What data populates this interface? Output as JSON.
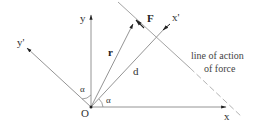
{
  "diagram": {
    "labels": {
      "y_axis": "y",
      "x_axis": "x",
      "y_prime_axis": "y'",
      "x_prime_axis": "x'",
      "origin": "O",
      "position_vector": "r",
      "force": "F",
      "distance": "d",
      "angle_left": "α",
      "angle_right": "α",
      "line_of_action_line1": "line of action",
      "line_of_action_line2": "of force"
    },
    "colors": {
      "axis": "#888888",
      "arrowhead": "#222222",
      "text": "#333333"
    }
  }
}
